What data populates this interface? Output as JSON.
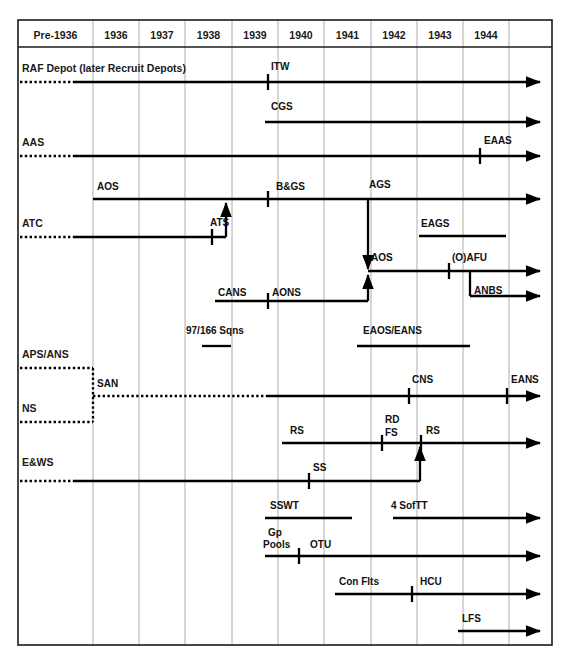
{
  "diagram": {
    "type": "timeline-gantt",
    "colors": {
      "line": "#000000",
      "grid": "#9a9a9a",
      "frame": "#1a1a1a",
      "text": "#1a1a1a",
      "background": "#ffffff"
    },
    "columns": [
      {
        "label": "Pre-1936",
        "x0": 18,
        "x1": 93
      },
      {
        "label": "1936",
        "x0": 93,
        "x1": 139
      },
      {
        "label": "1937",
        "x0": 139,
        "x1": 185
      },
      {
        "label": "1938",
        "x0": 185,
        "x1": 232
      },
      {
        "label": "1939",
        "x0": 232,
        "x1": 278
      },
      {
        "label": "1940",
        "x0": 278,
        "x1": 324
      },
      {
        "label": "1941",
        "x0": 324,
        "x1": 371
      },
      {
        "label": "1942",
        "x0": 371,
        "x1": 417
      },
      {
        "label": "1943",
        "x0": 417,
        "x1": 463
      },
      {
        "label": "1944",
        "x0": 463,
        "x1": 509
      },
      {
        "label": "",
        "x0": 509,
        "x1": 552
      }
    ],
    "row_labels": [
      {
        "text": "RAF Depot (later Recruit Depots)",
        "x": 22,
        "y": 72
      },
      {
        "text": "AAS",
        "x": 22,
        "y": 146
      },
      {
        "text": "ATC",
        "x": 22,
        "y": 227
      },
      {
        "text": "APS/ANS",
        "x": 22,
        "y": 358
      },
      {
        "text": "NS",
        "x": 22,
        "y": 412
      },
      {
        "text": "E&WS",
        "x": 22,
        "y": 466
      }
    ],
    "segment_labels": [
      {
        "text": "ITW",
        "x": 271,
        "y": 70
      },
      {
        "text": "CGS",
        "x": 271,
        "y": 110
      },
      {
        "text": "EAAS",
        "x": 484,
        "y": 144
      },
      {
        "text": "AOS",
        "x": 97,
        "y": 190
      },
      {
        "text": "B&GS",
        "x": 276,
        "y": 190
      },
      {
        "text": "AGS",
        "x": 369,
        "y": 188
      },
      {
        "text": "ATS",
        "x": 210,
        "y": 226
      },
      {
        "text": "EAGS",
        "x": 421,
        "y": 227
      },
      {
        "text": "AOS",
        "x": 371,
        "y": 261
      },
      {
        "text": "(O)AFU",
        "x": 452,
        "y": 261
      },
      {
        "text": "CANS",
        "x": 218,
        "y": 296
      },
      {
        "text": "AONS",
        "x": 272,
        "y": 296
      },
      {
        "text": "ANBS",
        "x": 474,
        "y": 294
      },
      {
        "text": "97/166 Sqns",
        "x": 186,
        "y": 334
      },
      {
        "text": "EAOS/EANS",
        "x": 363,
        "y": 334
      },
      {
        "text": "SAN",
        "x": 97,
        "y": 387
      },
      {
        "text": "CNS",
        "x": 412,
        "y": 383
      },
      {
        "text": "EANS",
        "x": 511,
        "y": 383
      },
      {
        "text": "RS",
        "x": 290,
        "y": 434
      },
      {
        "text": "RD",
        "x": 385,
        "y": 423
      },
      {
        "text": "FS",
        "x": 385,
        "y": 436
      },
      {
        "text": "RS",
        "x": 426,
        "y": 434
      },
      {
        "text": "SS",
        "x": 313,
        "y": 471
      },
      {
        "text": "SSWT",
        "x": 270,
        "y": 509
      },
      {
        "text": "4 SofTT",
        "x": 391,
        "y": 509
      },
      {
        "text": "Gp",
        "x": 268,
        "y": 536
      },
      {
        "text": "Pools",
        "x": 263,
        "y": 548
      },
      {
        "text": "OTU",
        "x": 310,
        "y": 548
      },
      {
        "text": "Con Flts",
        "x": 339,
        "y": 585
      },
      {
        "text": "HCU",
        "x": 420,
        "y": 585
      },
      {
        "text": "LFS",
        "x": 462,
        "y": 622
      }
    ],
    "tracks": [
      {
        "name": "raf-depot-dotted",
        "kind": "dotted",
        "points": "20,82 75,82"
      },
      {
        "name": "raf-depot-solid",
        "kind": "solid-arrow",
        "points": "75,82 540,82"
      },
      {
        "name": "cgs",
        "kind": "solid-arrow",
        "points": "265,122 540,122"
      },
      {
        "name": "aas-dotted",
        "kind": "dotted",
        "points": "20,156 75,156"
      },
      {
        "name": "aas-solid",
        "kind": "solid-arrow",
        "points": "75,156 540,156"
      },
      {
        "name": "aos-bgs-ags",
        "kind": "solid-arrow",
        "points": "93,199 540,199"
      },
      {
        "name": "atc-dotted",
        "kind": "dotted",
        "points": "20,237 75,237"
      },
      {
        "name": "atc-solid",
        "kind": "solid",
        "points": "75,237 226,237"
      },
      {
        "name": "ats-branch",
        "kind": "solid-arrow",
        "points": "226,237 226,203"
      },
      {
        "name": "eags-bar",
        "kind": "solid",
        "points": "419,236 506,236"
      },
      {
        "name": "ags-down-branch",
        "kind": "solid-arrow",
        "points": "368,199 368,269"
      },
      {
        "name": "aos-afu",
        "kind": "solid-arrow",
        "points": "368,271 540,271"
      },
      {
        "name": "cans-aons",
        "kind": "solid",
        "points": "215,301 368,301"
      },
      {
        "name": "cans-up-branch",
        "kind": "solid-arrow",
        "points": "368,301 368,275"
      },
      {
        "name": "anbs-down",
        "kind": "solid",
        "points": "470,271 470,296"
      },
      {
        "name": "anbs-right",
        "kind": "solid-arrow",
        "points": "470,296 540,296"
      },
      {
        "name": "sqns97-166-bar",
        "kind": "solid",
        "points": "202,346 231,346"
      },
      {
        "name": "eaos-eans-bar",
        "kind": "solid",
        "points": "357,346 470,346"
      },
      {
        "name": "aps-ans-dotted",
        "kind": "dotted",
        "points": "20,368 93,368"
      },
      {
        "name": "aps-ans-drop",
        "kind": "dotted",
        "points": "93,368 93,422"
      },
      {
        "name": "ns-dotted-left",
        "kind": "dotted",
        "points": "20,422 93,422"
      },
      {
        "name": "san-dotted",
        "kind": "dotted",
        "points": "93,396 268,396"
      },
      {
        "name": "ns-solid",
        "kind": "solid-arrow",
        "points": "268,396 540,396"
      },
      {
        "name": "rs-line",
        "kind": "solid-arrow",
        "points": "282,443 540,443"
      },
      {
        "name": "ews-dotted",
        "kind": "dotted",
        "points": "20,481 75,481"
      },
      {
        "name": "ews-solid",
        "kind": "solid",
        "points": "75,481 420,481"
      },
      {
        "name": "ews-up-branch",
        "kind": "solid-arrow",
        "points": "420,481 420,447"
      },
      {
        "name": "sswt-bar",
        "kind": "solid",
        "points": "265,518 352,518"
      },
      {
        "name": "4softt",
        "kind": "solid-arrow",
        "points": "393,518 540,518"
      },
      {
        "name": "gp-pools-otu",
        "kind": "solid-arrow",
        "points": "265,556 540,556"
      },
      {
        "name": "con-flts-hcu",
        "kind": "solid-arrow",
        "points": "335,594 540,594"
      },
      {
        "name": "lfs",
        "kind": "solid-arrow",
        "points": "458,631 540,631"
      }
    ],
    "ticks": [
      {
        "name": "tick-itw",
        "x": 268,
        "y": 82
      },
      {
        "name": "tick-eaas",
        "x": 480,
        "y": 156
      },
      {
        "name": "tick-bgs",
        "x": 268,
        "y": 199
      },
      {
        "name": "tick-ats",
        "x": 212,
        "y": 237
      },
      {
        "name": "tick-oafu",
        "x": 449,
        "y": 271
      },
      {
        "name": "tick-aons",
        "x": 268,
        "y": 301
      },
      {
        "name": "tick-cns",
        "x": 409,
        "y": 396
      },
      {
        "name": "tick-eans",
        "x": 507,
        "y": 396
      },
      {
        "name": "tick-rd-fs",
        "x": 382,
        "y": 443
      },
      {
        "name": "tick-rs2",
        "x": 421,
        "y": 443
      },
      {
        "name": "tick-ss",
        "x": 309,
        "y": 481
      },
      {
        "name": "tick-otu",
        "x": 299,
        "y": 556
      },
      {
        "name": "tick-hcu",
        "x": 412,
        "y": 594
      }
    ],
    "frame": {
      "x": 18,
      "y": 20,
      "width": 534,
      "height": 625,
      "header_y": 47
    }
  }
}
